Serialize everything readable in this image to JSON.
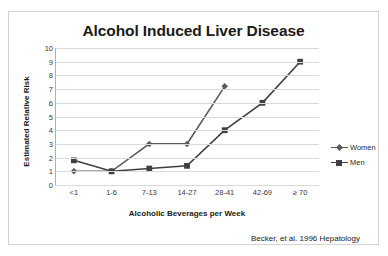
{
  "chart_data": {
    "type": "line",
    "title": "Alcohol Induced Liver Disease",
    "xlabel": "Alcoholic Beverages per Week",
    "ylabel": "Estimated Relative Risk",
    "categories": [
      "<1",
      "1-6",
      "7-13",
      "14-27",
      "28-41",
      "42-69",
      "≥ 70"
    ],
    "ylim": [
      0,
      10
    ],
    "yticks": [
      0,
      1,
      2,
      3,
      4,
      5,
      6,
      7,
      8,
      9,
      10
    ],
    "grid": true,
    "legend_position": "right",
    "series": [
      {
        "name": "Women",
        "marker": "diamond",
        "color": "#595959",
        "values": [
          1.0,
          1.0,
          3.0,
          3.0,
          7.2,
          null,
          null
        ]
      },
      {
        "name": "Men",
        "marker": "square",
        "color": "#404040",
        "values": [
          1.8,
          1.0,
          1.2,
          1.4,
          4.0,
          6.0,
          9.0
        ]
      }
    ],
    "annotation": "Becker, et al.  1996 Hepatology"
  },
  "chart": {
    "title": "Alcohol Induced Liver Disease",
    "y_axis_title": "Estimated Relative Risk",
    "x_axis_title": "Alcoholic Beverages per Week",
    "citation": "Becker, et al.  1996 Hepatology",
    "y_tick_labels": [
      "10",
      "9",
      "8",
      "7",
      "6",
      "5",
      "4",
      "3",
      "2",
      "1",
      "0"
    ],
    "x_tick_labels": [
      "<1",
      "1-6",
      "7-13",
      "14-27",
      "28-41",
      "42-69",
      "≥ 70"
    ],
    "legend": [
      {
        "label": "Women"
      },
      {
        "label": "Men"
      }
    ]
  }
}
